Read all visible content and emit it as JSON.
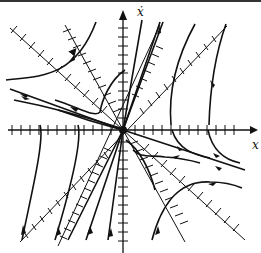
{
  "diagram": {
    "type": "phase-portrait",
    "x_axis_label": "x",
    "y_axis_label": "ẋ",
    "origin_px": [
      123,
      130
    ],
    "nullclines": [
      {
        "name": "nullcline-steep-positive",
        "from": [
          60,
          245
        ],
        "to": [
          160,
          20
        ]
      },
      {
        "name": "nullcline-shallow-positive",
        "from": [
          20,
          240
        ],
        "to": [
          225,
          28
        ]
      },
      {
        "name": "nullcline-steep-negative",
        "from": [
          65,
          25
        ],
        "to": [
          185,
          240
        ]
      },
      {
        "name": "nullcline-shallow-negative",
        "from": [
          10,
          28
        ],
        "to": [
          245,
          240
        ]
      }
    ],
    "colors": {
      "line": "#111111",
      "background": "#ffffff"
    }
  }
}
